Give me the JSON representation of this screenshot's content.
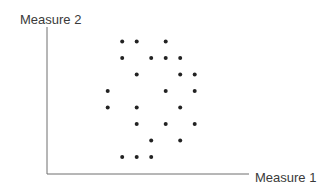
{
  "chart_data": {
    "type": "scatter",
    "title": "",
    "xlabel": "Measure 1",
    "ylabel": "Measure 2",
    "grid": false,
    "ticks": false,
    "legend": null,
    "xlim": [
      0,
      10
    ],
    "ylim": [
      0,
      10
    ],
    "points": [
      {
        "x": 2,
        "y": 8
      },
      {
        "x": 3,
        "y": 8
      },
      {
        "x": 5,
        "y": 8
      },
      {
        "x": 2,
        "y": 7
      },
      {
        "x": 4,
        "y": 7
      },
      {
        "x": 5,
        "y": 7
      },
      {
        "x": 6,
        "y": 7
      },
      {
        "x": 3,
        "y": 6
      },
      {
        "x": 6,
        "y": 6
      },
      {
        "x": 7,
        "y": 6
      },
      {
        "x": 1,
        "y": 5
      },
      {
        "x": 5,
        "y": 5
      },
      {
        "x": 7,
        "y": 5
      },
      {
        "x": 1,
        "y": 4
      },
      {
        "x": 3,
        "y": 4
      },
      {
        "x": 6,
        "y": 4
      },
      {
        "x": 3,
        "y": 3
      },
      {
        "x": 5,
        "y": 3
      },
      {
        "x": 7,
        "y": 3
      },
      {
        "x": 4,
        "y": 2
      },
      {
        "x": 6,
        "y": 2
      },
      {
        "x": 2,
        "y": 1
      },
      {
        "x": 3,
        "y": 1
      },
      {
        "x": 4,
        "y": 1
      }
    ],
    "colors": {
      "point": "#222222",
      "axis": "#6e6e6e",
      "text": "#3a3a3a"
    }
  }
}
